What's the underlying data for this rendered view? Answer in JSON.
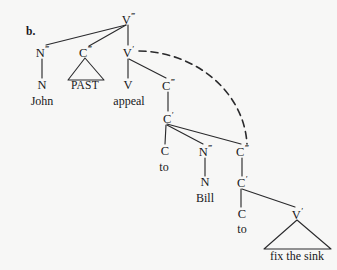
{
  "figure": {
    "enumeration_label": "b.",
    "background_color": "#f7f7f6",
    "ink_color": "#17171a",
    "sentence": "John PAST appeal to Bill to fix the sink"
  },
  "nodes": {
    "v3_top": {
      "label": "V",
      "prime": "‴",
      "x": 128,
      "y": 19
    },
    "n3_subj": {
      "label": "N",
      "prime": "‴",
      "x": 42,
      "y": 52
    },
    "c3_past": {
      "label": "C",
      "prime": "‴",
      "x": 85,
      "y": 52
    },
    "v1_mid": {
      "label": "V",
      "prime": "′",
      "x": 128,
      "y": 52
    },
    "n_subj": {
      "label": "N",
      "prime": "",
      "x": 42,
      "y": 85
    },
    "v_appeal": {
      "label": "V",
      "prime": "",
      "x": 128,
      "y": 85
    },
    "c3_upper": {
      "label": "C",
      "prime": "‴",
      "x": 168,
      "y": 85
    },
    "c1_upper": {
      "label": "C",
      "prime": "′",
      "x": 168,
      "y": 118
    },
    "c_to_upper": {
      "label": "C",
      "prime": "",
      "x": 165,
      "y": 151
    },
    "n3_obj": {
      "label": "N",
      "prime": "‴",
      "x": 205,
      "y": 151
    },
    "c3_lower": {
      "label": "C",
      "prime": "‴",
      "x": 242,
      "y": 151
    },
    "n_obj": {
      "label": "N",
      "prime": "",
      "x": 205,
      "y": 182
    },
    "c1_lower": {
      "label": "C",
      "prime": "′",
      "x": 242,
      "y": 182
    },
    "c_to_lower": {
      "label": "C",
      "prime": "",
      "x": 242,
      "y": 214
    },
    "v1_lower": {
      "label": "V",
      "prime": "′",
      "x": 297,
      "y": 214
    }
  },
  "terminals": {
    "john": {
      "text": "John",
      "x": 42,
      "y": 101
    },
    "past": {
      "text": "PAST",
      "x": 85,
      "y": 86
    },
    "appeal": {
      "text": "appeal",
      "x": 129,
      "y": 101
    },
    "to_upper": {
      "text": "to",
      "x": 164,
      "y": 167
    },
    "bill": {
      "text": "Bill",
      "x": 205,
      "y": 198
    },
    "to_lower": {
      "text": "to",
      "x": 242,
      "y": 229
    },
    "fix_the_sink": {
      "text": "fix the sink",
      "x": 297,
      "y": 256
    }
  },
  "triangles": [
    {
      "name": "past-triangle",
      "apex_x": 85,
      "apex_y": 58,
      "left_x": 68,
      "right_x": 104,
      "base_y": 80
    },
    {
      "name": "fix-the-sink-triangle",
      "apex_x": 297,
      "apex_y": 220,
      "left_x": 264,
      "right_x": 331,
      "base_y": 249
    }
  ],
  "branches": [
    {
      "name": "v3-to-n3-subj",
      "x1": 126,
      "y1": 25,
      "x2": 46,
      "y2": 45
    },
    {
      "name": "v3-to-c3-past",
      "x1": 126,
      "y1": 25,
      "x2": 89,
      "y2": 46
    },
    {
      "name": "v3-to-v1",
      "x1": 128,
      "y1": 25,
      "x2": 128,
      "y2": 45
    },
    {
      "name": "n3-to-n",
      "x1": 42,
      "y1": 59,
      "x2": 42,
      "y2": 78
    },
    {
      "name": "v1-to-v",
      "x1": 128,
      "y1": 59,
      "x2": 128,
      "y2": 78
    },
    {
      "name": "v1-to-c3upper",
      "x1": 129,
      "y1": 59,
      "x2": 166,
      "y2": 78
    },
    {
      "name": "c3upper-to-c1",
      "x1": 168,
      "y1": 92,
      "x2": 168,
      "y2": 111
    },
    {
      "name": "c1-to-c-to",
      "x1": 166,
      "y1": 125,
      "x2": 165,
      "y2": 144
    },
    {
      "name": "c1-to-n3obj",
      "x1": 167,
      "y1": 125,
      "x2": 203,
      "y2": 144
    },
    {
      "name": "c1-to-c3lower",
      "x1": 167,
      "y1": 124,
      "x2": 241,
      "y2": 144
    },
    {
      "name": "n3obj-to-n",
      "x1": 205,
      "y1": 158,
      "x2": 205,
      "y2": 176
    },
    {
      "name": "c3lower-to-c1low",
      "x1": 242,
      "y1": 158,
      "x2": 242,
      "y2": 176
    },
    {
      "name": "c1low-to-c-to",
      "x1": 241,
      "y1": 189,
      "x2": 241,
      "y2": 207
    },
    {
      "name": "c1low-to-v1low",
      "x1": 242,
      "y1": 189,
      "x2": 295,
      "y2": 207
    }
  ],
  "movement_arc": {
    "name": "movement-dashed-arc",
    "from_node": "v1_mid",
    "to_node": "c3_lower",
    "path": "M 139 51 C 196 52, 244 92, 247 144",
    "dash_pattern": "7 5",
    "stroke_width": 1.6
  }
}
